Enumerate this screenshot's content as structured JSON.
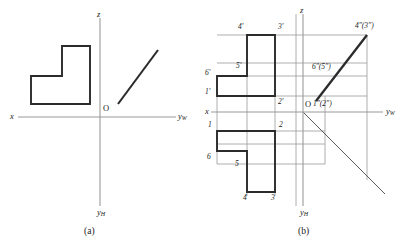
{
  "figure": {
    "type": "descriptive-geometry-orthographic-projection",
    "panels": [
      {
        "id": "a",
        "caption": "(a)",
        "axes": {
          "origin_label": "O",
          "x_label": "x",
          "yw_label": "y",
          "yw_sub": "W",
          "yh_label": "y",
          "yh_sub": "H",
          "z_label": "z"
        },
        "shapes": [
          {
            "name": "l-shaped-front-view",
            "kind": "polygon"
          },
          {
            "name": "oblique-line",
            "kind": "line"
          }
        ]
      },
      {
        "id": "b",
        "caption": "(b)",
        "axes": {
          "origin_label": "O",
          "x_label": "x",
          "yw_label": "y",
          "yw_sub": "W",
          "yh_label": "y",
          "yh_sub": "H",
          "z_label": "z"
        },
        "vertex_labels": {
          "front_view": [
            "4'",
            "3'",
            "5'",
            "6'",
            "1'",
            "2'"
          ],
          "top_view": [
            "1",
            "2",
            "6",
            "5",
            "4",
            "3"
          ],
          "side_view": [
            "4″(3″)",
            "6″(5″)",
            "1″(2″)"
          ]
        },
        "shapes": [
          {
            "name": "l-shaped-front-view",
            "kind": "polygon"
          },
          {
            "name": "l-shaped-top-view",
            "kind": "polygon"
          },
          {
            "name": "side-view-oblique-line",
            "kind": "line"
          },
          {
            "name": "forty-five-degree-miter-line",
            "kind": "line"
          },
          {
            "name": "projection-construction-lines",
            "kind": "thin-lines"
          }
        ]
      }
    ]
  },
  "colors": {
    "ink": "#1a1a1a",
    "thin_line": "#9a9a9a",
    "background": "#ffffff"
  }
}
